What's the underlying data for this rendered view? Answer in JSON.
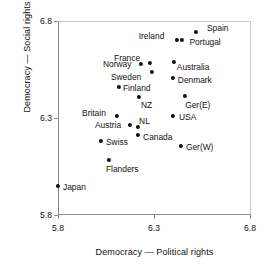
{
  "chart_data": {
    "type": "scatter",
    "title": "",
    "xlabel": "Democracy — Political rights",
    "ylabel": "Democracy — Social rights",
    "xlim": [
      5.8,
      6.8
    ],
    "ylim": [
      5.8,
      6.8
    ],
    "xticks": [
      "5.8",
      "6.3",
      "6.8"
    ],
    "xtick_values": [
      5.8,
      6.3,
      6.8
    ],
    "yticks": [
      "5.8",
      "6.3",
      "6.8"
    ],
    "ytick_values": [
      5.8,
      6.3,
      6.8
    ],
    "grid": false,
    "legend": "none",
    "marker_color": "#111111",
    "axis_color": "#8a8a8a",
    "points": [
      {
        "label": "Spain",
        "x": 6.515,
        "y": 6.743,
        "lx": 11,
        "ly": -4
      },
      {
        "label": "Portugal",
        "x": 6.44,
        "y": 6.701,
        "lx": 8,
        "ly": 2
      },
      {
        "label": "Ireland",
        "x": 6.415,
        "y": 6.702,
        "lx": -38,
        "ly": -4
      },
      {
        "label": "Australia",
        "x": 6.4,
        "y": 6.588,
        "lx": 3,
        "ly": 5
      },
      {
        "label": "France",
        "x": 6.277,
        "y": 6.583,
        "lx": -36,
        "ly": -5
      },
      {
        "label": "Norway",
        "x": 6.23,
        "y": 6.578,
        "lx": -38,
        "ly": 0
      },
      {
        "label": "Denmark",
        "x": 6.395,
        "y": 6.506,
        "lx": 5,
        "ly": 2
      },
      {
        "label": "Sweden",
        "x": 6.287,
        "y": 6.536,
        "lx": -41,
        "ly": 5
      },
      {
        "label": "Finland",
        "x": 6.116,
        "y": 6.459,
        "lx": 4,
        "ly": 1
      },
      {
        "label": "Ger(E)",
        "x": 6.459,
        "y": 6.413,
        "lx": 0,
        "ly": 9
      },
      {
        "label": "NZ",
        "x": 6.22,
        "y": 6.408,
        "lx": 2,
        "ly": 8
      },
      {
        "label": "Britain",
        "x": 6.106,
        "y": 6.31,
        "lx": -35,
        "ly": -3
      },
      {
        "label": "USA",
        "x": 6.396,
        "y": 6.31,
        "lx": 6,
        "ly": 1
      },
      {
        "label": "NL",
        "x": 6.215,
        "y": 6.253,
        "lx": 1,
        "ly": -6
      },
      {
        "label": "Austria",
        "x": 6.173,
        "y": 6.263,
        "lx": -35,
        "ly": 0
      },
      {
        "label": "Canada",
        "x": 6.215,
        "y": 6.211,
        "lx": 5,
        "ly": 2
      },
      {
        "label": "Swiss",
        "x": 6.023,
        "y": 6.18,
        "lx": 5,
        "ly": 1
      },
      {
        "label": "Ger(W)",
        "x": 6.437,
        "y": 6.155,
        "lx": 5,
        "ly": 1
      },
      {
        "label": "Flanders",
        "x": 6.064,
        "y": 6.083,
        "lx": -3,
        "ly": 9
      },
      {
        "label": "Japan",
        "x": 5.8,
        "y": 5.948,
        "lx": 5,
        "ly": 1
      }
    ]
  }
}
